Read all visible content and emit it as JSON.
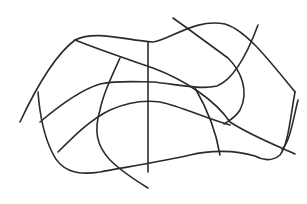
{
  "figure": {
    "type": "line-sketch",
    "background": "#ffffff",
    "stroke_color": "#2b2b2b",
    "paths": [
      {
        "id": "outer-top",
        "d": "M20 122 C35 90 55 55 75 40 C95 30 125 40 153 42 C170 40 195 18 225 24 C245 30 265 55 295 92"
      },
      {
        "id": "outer-right",
        "d": "M295 92 C290 120 288 145 280 155 C272 162 262 160 255 156 C235 150 210 150 190 155 C160 162 120 168 100 172 C75 176 60 170 52 152 C44 136 40 118 38 92"
      },
      {
        "id": "diagonal-upper",
        "d": "M75 40 C100 50 130 60 153 68 C185 80 215 100 230 122 C250 135 275 145 295 154"
      },
      {
        "id": "vertical-center",
        "d": "M148 42 L148 172"
      },
      {
        "id": "left-inner-arc",
        "d": "M120 58 C110 80 103 95 100 110 C94 130 96 145 110 160 C122 172 135 180 148 188"
      },
      {
        "id": "middle-horizontal",
        "d": "M40 122 C60 105 80 90 100 84 C120 80 140 82 153 82 C175 84 200 90 217 86 C232 80 245 60 258 25"
      },
      {
        "id": "lower-horizontal",
        "d": "M58 152 C75 135 90 120 110 110 C128 102 145 100 160 102 C180 106 205 118 230 125"
      },
      {
        "id": "upper-right-diagonal",
        "d": "M173 18 C190 30 210 45 228 58 C240 70 250 90 240 110 C235 118 230 120 224 124"
      },
      {
        "id": "lower-right-curve",
        "d": "M195 88 C205 105 215 125 220 155"
      },
      {
        "id": "far-right-arc",
        "d": "M298 100 C292 125 290 140 282 150"
      }
    ]
  }
}
